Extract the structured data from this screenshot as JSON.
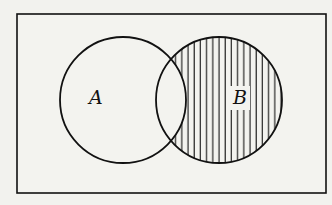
{
  "diagram": {
    "type": "venn",
    "universe": {
      "label": ""
    },
    "sets": [
      {
        "id": "A",
        "label": "A",
        "cx": 123,
        "cy": 100,
        "r": 63
      },
      {
        "id": "B",
        "label": "B",
        "cx": 219,
        "cy": 100,
        "r": 63
      }
    ],
    "shaded_region": "B - A",
    "shading": "vertical-hatch",
    "colors": {
      "stroke": "#111111",
      "background": "#f2f2ee"
    }
  }
}
